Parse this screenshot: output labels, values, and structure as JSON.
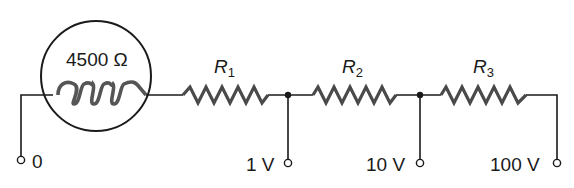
{
  "diagram": {
    "type": "circuit-schematic",
    "title": "",
    "meter": {
      "label": "4500 Ω",
      "element": "coil-inside-circle"
    },
    "resistors": [
      {
        "name": "R",
        "sub": "1"
      },
      {
        "name": "R",
        "sub": "2"
      },
      {
        "name": "R",
        "sub": "3"
      }
    ],
    "terminals": [
      {
        "label": "0"
      },
      {
        "label": "1 V"
      },
      {
        "label": "10 V"
      },
      {
        "label": "100 V"
      }
    ],
    "colors": {
      "line": "#1a1a1a",
      "component": "#4a4a4a",
      "background": "#ffffff"
    }
  }
}
